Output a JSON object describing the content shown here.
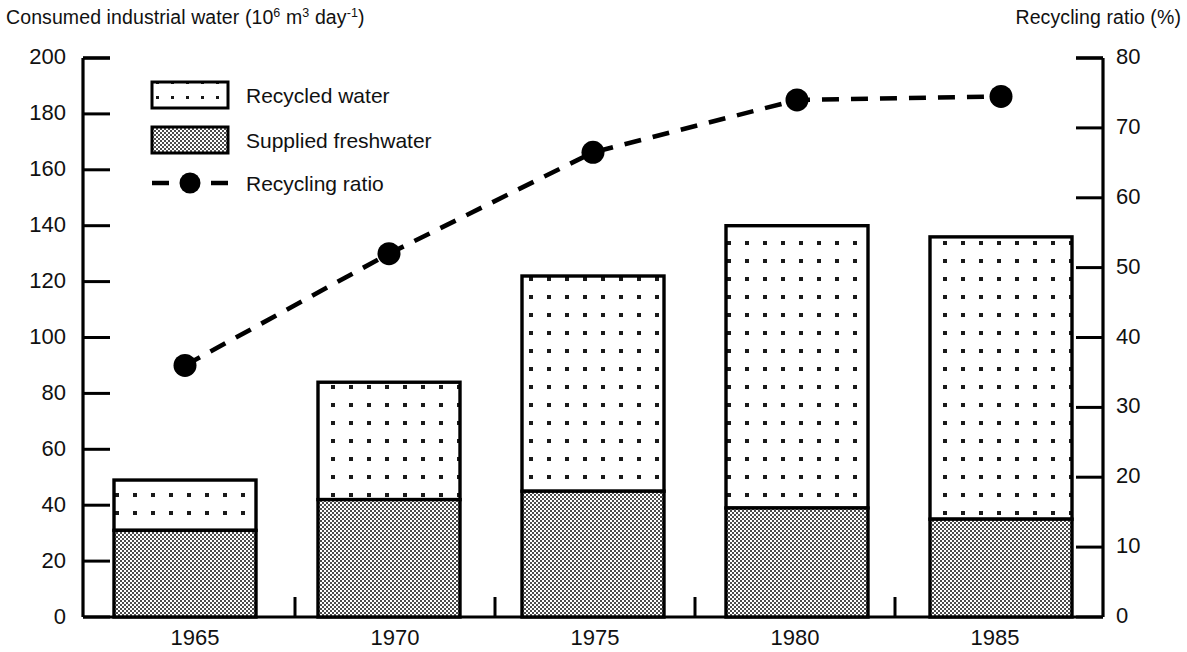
{
  "chart_data": {
    "type": "bar",
    "title": "",
    "subtitle": "",
    "categories": [
      "1965",
      "1970",
      "1975",
      "1980",
      "1985"
    ],
    "xlabel": "",
    "ylabel": "Consumed industrial water (10^6 m^3 day^-1)",
    "y2label": "Recycling ratio (%)",
    "ylim": [
      0,
      200
    ],
    "y2lim": [
      0,
      80
    ],
    "ytick_labels": [
      "200",
      "180",
      "160",
      "140",
      "120",
      "100",
      "80",
      "60",
      "40",
      "20",
      "0"
    ],
    "ytick_values": [
      200,
      180,
      160,
      140,
      120,
      100,
      80,
      60,
      40,
      20,
      0
    ],
    "y2tick_labels": [
      "80",
      "70",
      "60",
      "50",
      "40",
      "30",
      "20",
      "10",
      "0"
    ],
    "y2tick_values": [
      80,
      70,
      60,
      50,
      40,
      30,
      20,
      10,
      0
    ],
    "grid": false,
    "legend_position": "upper left",
    "stacked": true,
    "series": [
      {
        "name": "Supplied freshwater",
        "type": "bar",
        "axis": "left",
        "values": [
          31,
          42,
          45,
          39,
          35
        ],
        "fill": "checker-gray"
      },
      {
        "name": "Recycled water",
        "type": "bar",
        "axis": "left",
        "values": [
          18,
          42,
          77,
          101,
          101
        ],
        "totals": [
          49,
          84,
          122,
          140,
          136
        ],
        "fill": "dotted-white"
      },
      {
        "name": "Recycling ratio",
        "type": "line",
        "axis": "right",
        "values": [
          36,
          52,
          66.5,
          74,
          74.5
        ],
        "style": "dashed",
        "marker": "filled-circle"
      }
    ]
  },
  "axes": {
    "left_title_main": "Consumed industrial water (10",
    "left_title_sup1": "6",
    "left_title_mid": " m",
    "left_title_sup2": "3",
    "left_title_mid2": " day",
    "left_title_sup3": "-1",
    "left_title_end": ")",
    "right_title": "Recycling ratio (%)"
  },
  "legend": {
    "items": [
      {
        "label": "Recycled water",
        "swatch": "dotted-white-box"
      },
      {
        "label": "Supplied freshwater",
        "swatch": "checker-gray-box"
      },
      {
        "label": "Recycling ratio",
        "swatch": "dashed-line-with-circle"
      }
    ]
  },
  "colors": {
    "axis": "#000000",
    "bar_outline": "#000000",
    "freshwater_fill": "#9a9a9a",
    "recycled_fill": "#ffffff",
    "line": "#000000",
    "text": "#111111"
  }
}
